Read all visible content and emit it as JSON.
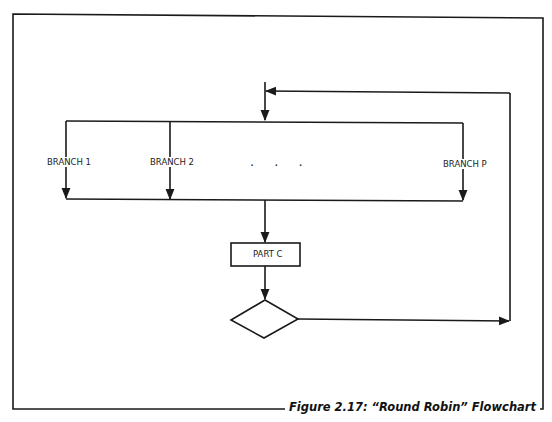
{
  "figure": {
    "caption": "Figure 2.17: “Round Robin” Flowchart"
  },
  "diagram": {
    "type": "flowchart",
    "branches": [
      {
        "label": "BRANCH 1"
      },
      {
        "label": "BRANCH 2"
      },
      {
        "label": "BRANCH P"
      }
    ],
    "ellipsis": ". . .",
    "process_box": {
      "label": "PART C"
    },
    "decision": {
      "label": ""
    },
    "colors": {
      "line": "#1a1a1a",
      "background": "#ffffff"
    }
  }
}
